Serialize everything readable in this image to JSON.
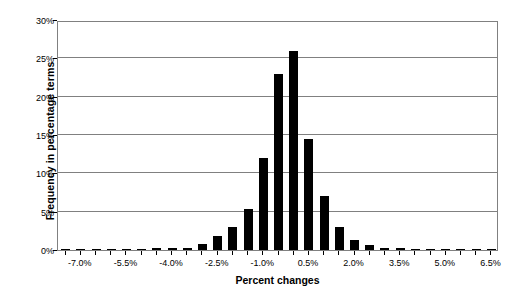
{
  "chart_data": {
    "type": "bar",
    "title": "",
    "subtitle": "",
    "xlabel": "Percent changes",
    "ylabel": "Frequency in percentage terms",
    "grid": true,
    "legend": false,
    "legend_position": "none",
    "bar_color": "#000000",
    "grid_color": "#808080",
    "frame_color": "#808080",
    "xlim": [
      -7.75,
      6.75
    ],
    "ylim": [
      0,
      30
    ],
    "bin_width": 0.5,
    "y_ticks": [
      0,
      5,
      10,
      15,
      20,
      25,
      30
    ],
    "y_tick_labels": [
      "0%",
      "5%",
      "10%",
      "15%",
      "20%",
      "25%",
      "30%"
    ],
    "x_ticks": [
      -7.0,
      -5.5,
      -4.0,
      -2.5,
      -1.0,
      0.5,
      2.0,
      3.5,
      5.0,
      6.5
    ],
    "x_tick_labels": [
      "-7.0%",
      "-5.5%",
      "-4.0%",
      "-2.5%",
      "-1.0%",
      "0.5%",
      "2.0%",
      "3.5%",
      "5.0%",
      "6.5%"
    ],
    "categories": [
      "-7.5%",
      "-7.0%",
      "-6.5%",
      "-6.0%",
      "-5.5%",
      "-5.0%",
      "-4.5%",
      "-4.0%",
      "-3.5%",
      "-3.0%",
      "-2.5%",
      "-2.0%",
      "-1.5%",
      "-1.0%",
      "-0.5%",
      "0.0%",
      "0.5%",
      "1.0%",
      "1.5%",
      "2.0%",
      "2.5%",
      "3.0%",
      "3.5%",
      "4.0%",
      "4.5%",
      "5.0%",
      "5.5%",
      "6.0%",
      "6.5%"
    ],
    "x": [
      -7.5,
      -7.0,
      -6.5,
      -6.0,
      -5.5,
      -5.0,
      -4.5,
      -4.0,
      -3.5,
      -3.0,
      -2.5,
      -2.0,
      -1.5,
      -1.0,
      -0.5,
      0.0,
      0.5,
      1.0,
      1.5,
      2.0,
      2.5,
      3.0,
      3.5,
      4.0,
      4.5,
      5.0,
      5.5,
      6.0,
      6.5
    ],
    "values": [
      0.1,
      0.1,
      0.1,
      0.1,
      0.1,
      0.1,
      0.2,
      0.2,
      0.3,
      0.8,
      1.8,
      3.0,
      5.4,
      12.0,
      23.0,
      26.0,
      14.5,
      7.0,
      3.0,
      1.3,
      0.6,
      0.3,
      0.2,
      0.1,
      0.1,
      0.1,
      0.1,
      0.1,
      0.1
    ],
    "series": [
      {
        "name": "Frequency",
        "values": [
          0.1,
          0.1,
          0.1,
          0.1,
          0.1,
          0.1,
          0.2,
          0.2,
          0.3,
          0.8,
          1.8,
          3.0,
          5.4,
          12.0,
          23.0,
          26.0,
          14.5,
          7.0,
          3.0,
          1.3,
          0.6,
          0.3,
          0.2,
          0.1,
          0.1,
          0.1,
          0.1,
          0.1,
          0.1
        ]
      }
    ]
  }
}
